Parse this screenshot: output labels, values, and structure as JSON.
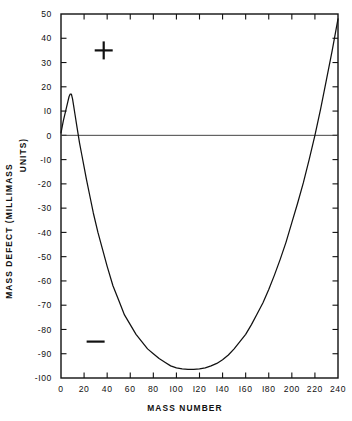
{
  "chart_data": {
    "type": "line",
    "title": "",
    "xlabel": "MASS NUMBER",
    "ylabel_line1": "MASS DEFECT (MILLIMASS",
    "ylabel_line2": "UNITS)",
    "xlim": [
      0,
      240
    ],
    "ylim": [
      -100,
      50
    ],
    "xticks": [
      0,
      20,
      40,
      60,
      80,
      100,
      120,
      140,
      160,
      180,
      200,
      220,
      240
    ],
    "xtick_labels": [
      "0",
      "20",
      "40",
      "60",
      "80",
      "I00",
      "I20",
      "I40",
      "I60",
      "I80",
      "200",
      "220",
      "240"
    ],
    "yticks": [
      50,
      40,
      30,
      20,
      10,
      0,
      -10,
      -20,
      -30,
      -40,
      -50,
      -60,
      -70,
      -80,
      -90,
      -100
    ],
    "ytick_labels": [
      "50",
      "40",
      "30",
      "20",
      "I0",
      "0",
      "-I0",
      "-20",
      "-30",
      "-40",
      "-50",
      "-60",
      "-70",
      "-80",
      "-90",
      "-I00"
    ],
    "grid": false,
    "legend": null,
    "zero_reference_line": 0,
    "series": [
      {
        "name": "mass defect",
        "x": [
          0,
          2,
          4,
          6,
          7,
          8,
          9,
          10,
          11,
          12,
          14,
          16,
          18,
          20,
          22,
          25,
          28,
          32,
          36,
          40,
          45,
          50,
          55,
          60,
          65,
          70,
          75,
          80,
          85,
          90,
          95,
          100,
          105,
          110,
          115,
          120,
          125,
          130,
          135,
          140,
          145,
          150,
          155,
          160,
          165,
          170,
          175,
          180,
          185,
          190,
          195,
          200,
          205,
          210,
          215,
          220,
          225,
          230,
          235,
          240
        ],
        "y": [
          1,
          6,
          10,
          14,
          16,
          17,
          17,
          15,
          12,
          9,
          3,
          -3,
          -8,
          -13,
          -18,
          -25,
          -32,
          -40,
          -47,
          -54,
          -62,
          -68,
          -74,
          -78,
          -82,
          -85,
          -88,
          -90,
          -92,
          -93.5,
          -95,
          -95.8,
          -96.2,
          -96.4,
          -96.4,
          -96.2,
          -95.8,
          -95,
          -94,
          -92.5,
          -90.5,
          -88,
          -85,
          -82,
          -78,
          -73.5,
          -69,
          -63.5,
          -57.5,
          -51,
          -44,
          -36,
          -28,
          -19.5,
          -10,
          0,
          11,
          23,
          35,
          48
        ]
      }
    ],
    "annotations": [
      {
        "name": "plus-sign",
        "symbol": "+",
        "x": 37,
        "y": 35
      },
      {
        "name": "minus-sign",
        "symbol": "−",
        "x": 30,
        "y": -85
      }
    ]
  }
}
